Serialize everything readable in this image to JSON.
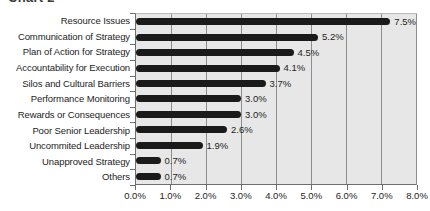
{
  "chart_data": {
    "type": "bar",
    "orientation": "horizontal",
    "title": "Chart 2",
    "xlabel": "",
    "ylabel": "",
    "xlim": [
      0,
      8
    ],
    "xticks": [
      "0.0%",
      "1.0%",
      "2.0%",
      "3.0%",
      "4.0%",
      "5.0%",
      "6.0%",
      "7.0%",
      "8.0%"
    ],
    "xtick_values": [
      0,
      1,
      2,
      3,
      4,
      5,
      6,
      7,
      8
    ],
    "grid": true,
    "legend": false,
    "categories": [
      "Resource Issues",
      "Communication of Strategy",
      "Plan of Action for Strategy",
      "Accountability for Execution",
      "Silos and Cultural Barriers",
      "Performance Monitoring",
      "Rewards or Consequences",
      "Poor Senior Leadership",
      "Uncommited Leadership",
      "Unapproved Strategy",
      "Others"
    ],
    "values": [
      7.5,
      5.2,
      4.5,
      4.1,
      3.7,
      3.0,
      3.0,
      2.6,
      1.9,
      0.7,
      0.7
    ],
    "data_labels": [
      "7.5%",
      "5.2%",
      "4.5%",
      "4.1%",
      "3.7%",
      "3.0%",
      "3.0%",
      "2.6%",
      "1.9%",
      "0.7%",
      "0.7%"
    ],
    "colors": {
      "bar": "#1a1a1a",
      "plot_background": "#e7e7e7",
      "gridline": "#8d8d8d",
      "axis": "#6e6e6e",
      "text": "#1d1d1d",
      "figure_background": "#ffffff"
    }
  }
}
